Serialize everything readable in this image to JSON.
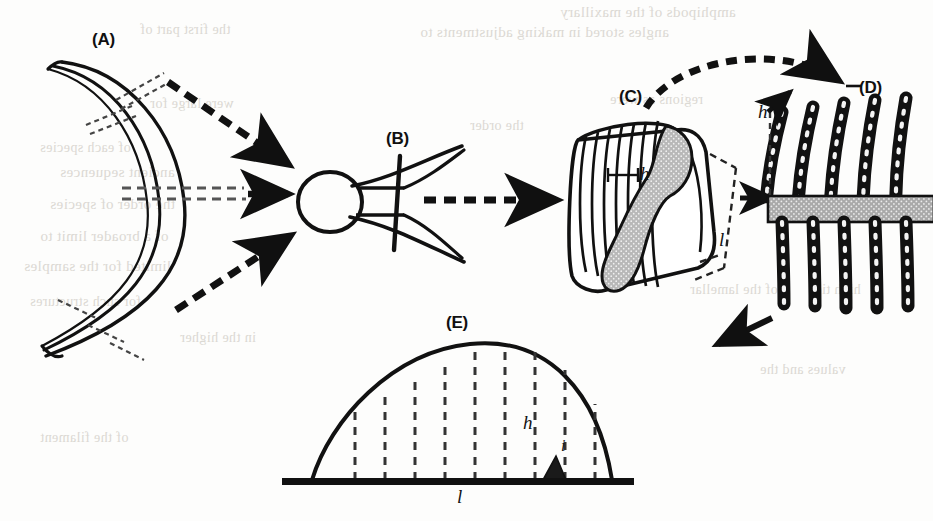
{
  "figure": {
    "domain": "Diagram",
    "background_color": "#fdfdfc",
    "ink_color": "#101010",
    "shade_color": "#b8b8b8"
  },
  "panels": [
    {
      "id": "A",
      "label": "(A)",
      "label_x": 92,
      "label_y": 30,
      "description": "gill arch, crescent shape with dashed tick marks"
    },
    {
      "id": "B",
      "label": "(B)",
      "label_x": 386,
      "label_y": 129,
      "description": "gill filament pair with bulb and branching rays"
    },
    {
      "id": "C",
      "label": "(C)",
      "label_x": 619,
      "label_y": 87,
      "description": "three dimensional block of secondary lamellae"
    },
    {
      "id": "D",
      "label": "(D)",
      "label_x": 859,
      "label_y": 78,
      "description": "cross section of lamellae crossing a shaded band"
    },
    {
      "id": "E",
      "label": "(E)",
      "label_x": 446,
      "label_y": 313,
      "description": "single lamella profile with dashed measurement lines"
    }
  ],
  "variable_labels": [
    {
      "name": "h-label-panel-c",
      "text": "h",
      "x": 640,
      "y": 163,
      "size": "normal"
    },
    {
      "name": "l-label-panel-c",
      "text": "l",
      "x": 719,
      "y": 229,
      "size": "normal"
    },
    {
      "name": "h-label-panel-d",
      "text": "h",
      "x": 758,
      "y": 101,
      "size": "normal"
    },
    {
      "name": "h-label-panel-e",
      "text": "h",
      "x": 523,
      "y": 412,
      "size": "normal"
    },
    {
      "name": "i-label-panel-e",
      "text": "i",
      "x": 561,
      "y": 437,
      "size": "small"
    },
    {
      "name": "l-label-panel-e",
      "text": "l",
      "x": 457,
      "y": 486,
      "size": "normal"
    }
  ],
  "ghost_text": {
    "note": "faint mirrored bleed-through text from the reverse of the scanned page",
    "lines": [
      {
        "text": "amphipods of the maxillary",
        "x": 560,
        "y": 4,
        "size": 15
      },
      {
        "text": "angles stored in making adjustments to",
        "x": 420,
        "y": 24,
        "size": 15
      },
      {
        "text": "the first part of",
        "x": 140,
        "y": 22,
        "size": 14
      },
      {
        "text": "regions as were",
        "x": 610,
        "y": 92,
        "size": 14
      },
      {
        "text": "were large for",
        "x": 150,
        "y": 96,
        "size": 14
      },
      {
        "text": "the order",
        "x": 470,
        "y": 118,
        "size": 14
      },
      {
        "text": "of each species",
        "x": 40,
        "y": 140,
        "size": 14
      },
      {
        "text": "ancient sequences",
        "x": 60,
        "y": 164,
        "size": 15
      },
      {
        "text": "the order of species",
        "x": 50,
        "y": 196,
        "size": 15
      },
      {
        "text": "of a broader limit to",
        "x": 40,
        "y": 228,
        "size": 15
      },
      {
        "text": "limited for the samples",
        "x": 24,
        "y": 258,
        "size": 15
      },
      {
        "text": "the gill surface",
        "x": 590,
        "y": 246,
        "size": 14
      },
      {
        "text": "of the lamellar",
        "x": 690,
        "y": 282,
        "size": 14
      },
      {
        "text": "high tier",
        "x": 810,
        "y": 282,
        "size": 14
      },
      {
        "text": "for such structures",
        "x": 30,
        "y": 294,
        "size": 14
      },
      {
        "text": "in the higher",
        "x": 180,
        "y": 330,
        "size": 14
      },
      {
        "text": "values and the",
        "x": 760,
        "y": 362,
        "size": 14
      },
      {
        "text": "of the filament",
        "x": 40,
        "y": 430,
        "size": 14
      }
    ]
  },
  "arrows": [
    {
      "name": "arrow-a-top-to-b",
      "style": "dashed",
      "from": "A upper limb",
      "to": "B"
    },
    {
      "name": "arrow-a-middle-to-b",
      "style": "dashed",
      "from": "A middle",
      "to": "B"
    },
    {
      "name": "arrow-a-bottom-to-b",
      "style": "dashed",
      "from": "A lower limb",
      "to": "B"
    },
    {
      "name": "arrow-b-to-c",
      "style": "dashed",
      "from": "B",
      "to": "C"
    },
    {
      "name": "arrow-c-to-d",
      "style": "dashed-arc",
      "from": "C",
      "to": "D"
    },
    {
      "name": "arrow-c-to-d-straight",
      "style": "solid-short",
      "from": "C bracket",
      "to": "D"
    },
    {
      "name": "arrow-h-pointer-panel-d",
      "style": "solid-short",
      "from": "h label",
      "to": "lamella tip"
    },
    {
      "name": "arrow-d-to-e",
      "style": "solid-short",
      "from": "D",
      "to": "E"
    }
  ],
  "panel_e_chart": {
    "type": "profile",
    "baseline_label": "l",
    "height_label": "h",
    "interlamellar_label": "i",
    "dashed_line_count": 9,
    "curve_description": "asymmetric dome, steep right flank"
  }
}
